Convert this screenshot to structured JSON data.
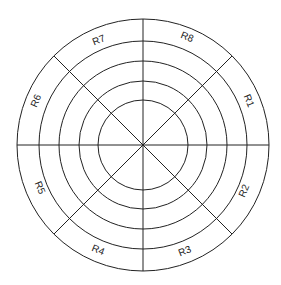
{
  "diagram": {
    "type": "polar-target-grid",
    "center": [
      143,
      145
    ],
    "ring_radii": [
      126,
      104,
      84,
      64,
      45
    ],
    "stroke_color": "#222222",
    "background": "#ffffff",
    "sector_labels": [
      "R1",
      "R2",
      "R3",
      "R4",
      "R5",
      "R6",
      "R7",
      "R8"
    ]
  }
}
